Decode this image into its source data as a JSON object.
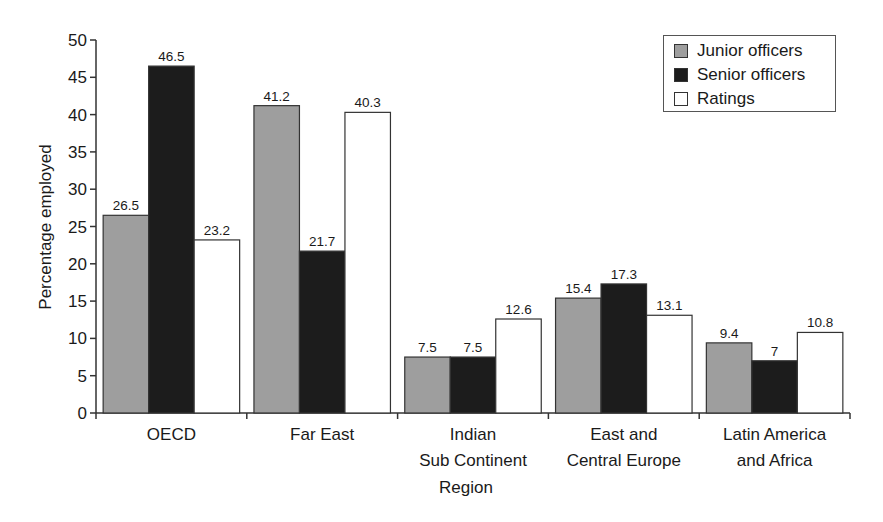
{
  "chart_data": {
    "type": "bar",
    "title": "",
    "xlabel": "Region",
    "ylabel": "Percentage employed",
    "ylim": [
      0,
      50
    ],
    "yticks": [
      0,
      5,
      10,
      15,
      20,
      25,
      30,
      35,
      40,
      45,
      50
    ],
    "grid": false,
    "legend_position": "top-right",
    "categories": [
      [
        "OECD"
      ],
      [
        "Far East"
      ],
      [
        "Indian",
        "Sub Continent"
      ],
      [
        "East and",
        "Central Europe"
      ],
      [
        "Latin America",
        "and Africa"
      ]
    ],
    "series": [
      {
        "name": "Junior officers",
        "color": "#9e9e9e",
        "values": [
          26.5,
          41.2,
          7.5,
          15.4,
          9.4
        ],
        "labels": [
          "26.5",
          "41.2",
          "7.5",
          "15.4",
          "9.4"
        ]
      },
      {
        "name": "Senior officers",
        "color": "#1c1c1c",
        "values": [
          46.5,
          21.7,
          7.5,
          17.3,
          7
        ],
        "labels": [
          "46.5",
          "21.7",
          "7.5",
          "17.3",
          "7"
        ]
      },
      {
        "name": "Ratings",
        "color": "#ffffff",
        "values": [
          23.2,
          40.3,
          12.6,
          13.1,
          10.8
        ],
        "labels": [
          "23.2",
          "40.3",
          "12.6",
          "13.1",
          "10.8"
        ]
      }
    ]
  },
  "legend": {
    "items": [
      {
        "label": "Junior officers",
        "color": "#9e9e9e"
      },
      {
        "label": "Senior officers",
        "color": "#1c1c1c"
      },
      {
        "label": "Ratings",
        "color": "#ffffff"
      }
    ]
  }
}
